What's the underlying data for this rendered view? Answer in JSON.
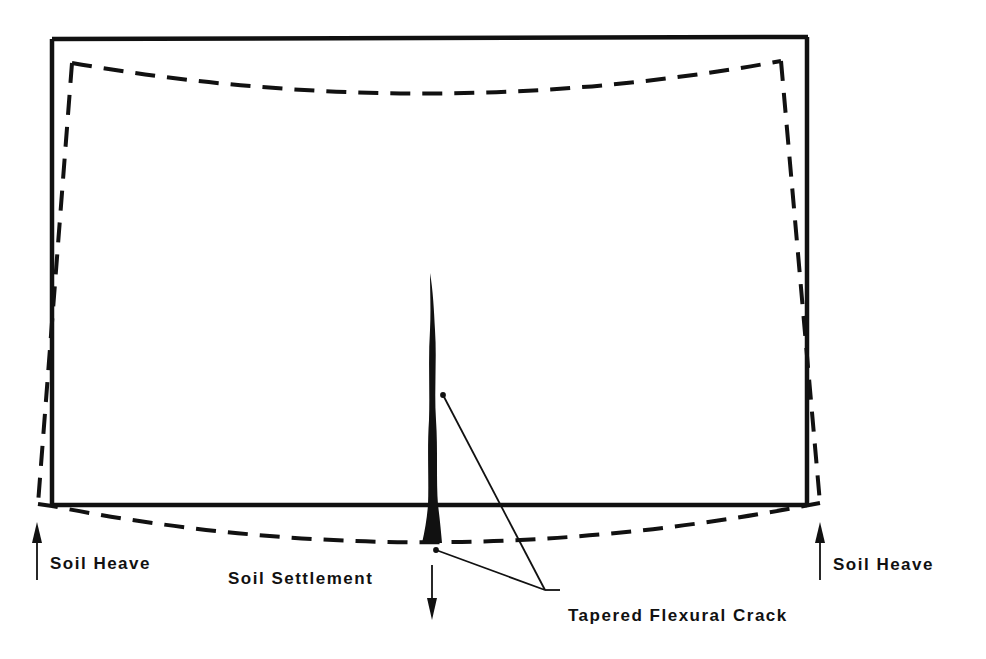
{
  "diagram": {
    "colors": {
      "ink": "#111111",
      "background": "#ffffff"
    },
    "labels": {
      "soil_heave_left": "Soil Heave",
      "soil_heave_right": "Soil Heave",
      "soil_settlement": "Soil Settlement",
      "crack": "Tapered Flexural Crack"
    },
    "elements": {
      "original_wall": "solid rectangle outline",
      "deformed_wall": "dashed outline (sagging top and bottom edges)",
      "crack": "tapered vertical crack at mid-span, widest at base",
      "arrows": [
        "up arrow left (heave)",
        "up arrow right (heave)",
        "down arrow center (settlement)"
      ]
    }
  }
}
